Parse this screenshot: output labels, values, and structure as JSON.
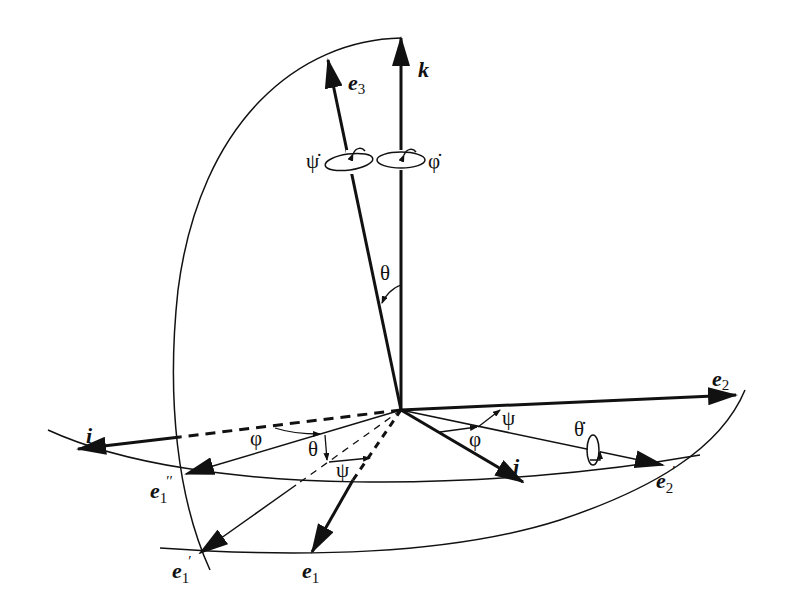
{
  "diagram": {
    "colors": {
      "ink": "#111111",
      "background": "#ffffff"
    },
    "vectors": {
      "k": "k",
      "e3": "e",
      "e3_sub": "3",
      "i": "i",
      "j": "j",
      "e2": "e",
      "e2_sub": "2",
      "e1": "e",
      "e1_sub": "1",
      "e1_prime": "e",
      "e1_prime_sub": "1",
      "e1_prime_mark": "′",
      "e1_dprime": "e",
      "e1_dprime_sub": "1",
      "e1_dprime_mark": "′′",
      "e2_prime": "e",
      "e2_prime_sub": "2",
      "e2_prime_mark": "′"
    },
    "angles": {
      "theta_top": "θ",
      "phi_left": "φ",
      "theta_left": "θ",
      "psi_left": "ψ",
      "phi_right": "φ",
      "psi_right": "ψ"
    },
    "rates": {
      "psi_dot": "ψ̇",
      "phi_dot": "φ̇",
      "theta_dot": "θ̇"
    }
  }
}
